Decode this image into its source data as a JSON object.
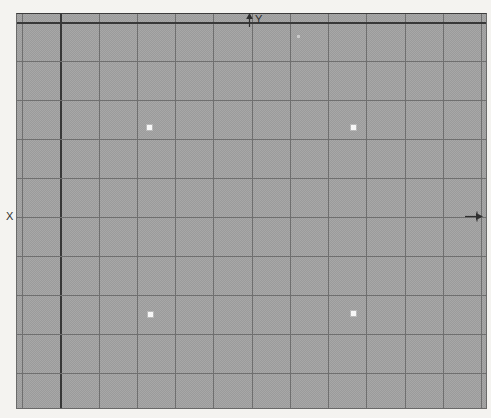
{
  "axis_indicators": {
    "y_label": "Y",
    "x_label": "X"
  },
  "colors": {
    "margin_bg": "#f4f3f0",
    "canvas_dither_light": "#a8a8a8",
    "canvas_dither_dark": "#9b9b9b",
    "grid_line": "#6f6f6f",
    "major_line": "#383838",
    "marker_bright": "#f7f7f7",
    "marker_faint": "#c9c9c9",
    "label_color": "#2f2f2f"
  },
  "grid": {
    "canvas_origin_x": 17,
    "canvas_origin_y": 14,
    "first_vertical_x": 22,
    "vertical_count": 13,
    "vertical_spacing": 38.25,
    "major_vertical_index": 1,
    "first_horizontal_y": 22,
    "horizontal_count": 10,
    "horizontal_spacing": 39,
    "major_horizontal_index": 0
  },
  "markers": [
    {
      "x": 149,
      "y": 127,
      "size": 5,
      "type": "bright"
    },
    {
      "x": 353,
      "y": 127,
      "size": 5,
      "type": "bright"
    },
    {
      "x": 150,
      "y": 314,
      "size": 5,
      "type": "bright"
    },
    {
      "x": 353,
      "y": 313,
      "size": 5,
      "type": "bright"
    },
    {
      "x": 298,
      "y": 36,
      "size": 3,
      "type": "faint"
    }
  ]
}
